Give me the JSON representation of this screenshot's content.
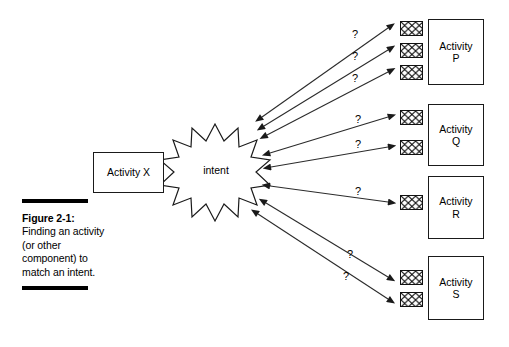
{
  "figure": {
    "caption_label": "Figure 2-1:",
    "caption_body": "Finding an activity (or other component) to match an intent."
  },
  "source_node": {
    "id": "activity-x",
    "label": "Activity X"
  },
  "intent_node": {
    "id": "intent",
    "label": "intent",
    "shape": "starburst"
  },
  "target_nodes": [
    {
      "id": "activity-p",
      "label": "Activity\nP",
      "filter_count": 3
    },
    {
      "id": "activity-q",
      "label": "Activity\nQ",
      "filter_count": 2
    },
    {
      "id": "activity-r",
      "label": "Activity\nR",
      "filter_count": 1
    },
    {
      "id": "activity-s",
      "label": "Activity\nS",
      "filter_count": 2
    }
  ],
  "edges": [
    {
      "from": "intent",
      "to": "activity-p-filter-1",
      "label": "?"
    },
    {
      "from": "intent",
      "to": "activity-p-filter-2",
      "label": "?"
    },
    {
      "from": "intent",
      "to": "activity-p-filter-3",
      "label": "?"
    },
    {
      "from": "intent",
      "to": "activity-q-filter-1",
      "label": "?"
    },
    {
      "from": "intent",
      "to": "activity-q-filter-2",
      "label": "?"
    },
    {
      "from": "intent",
      "to": "activity-r-filter-1",
      "label": "?"
    },
    {
      "from": "intent",
      "to": "activity-s-filter-1",
      "label": "?"
    },
    {
      "from": "intent",
      "to": "activity-s-filter-2",
      "label": "?"
    }
  ],
  "edge_label": "?",
  "colors": {
    "stroke": "#1a1a1a",
    "line": "#2b2b2b",
    "background": "#ffffff",
    "text": "#000000"
  }
}
